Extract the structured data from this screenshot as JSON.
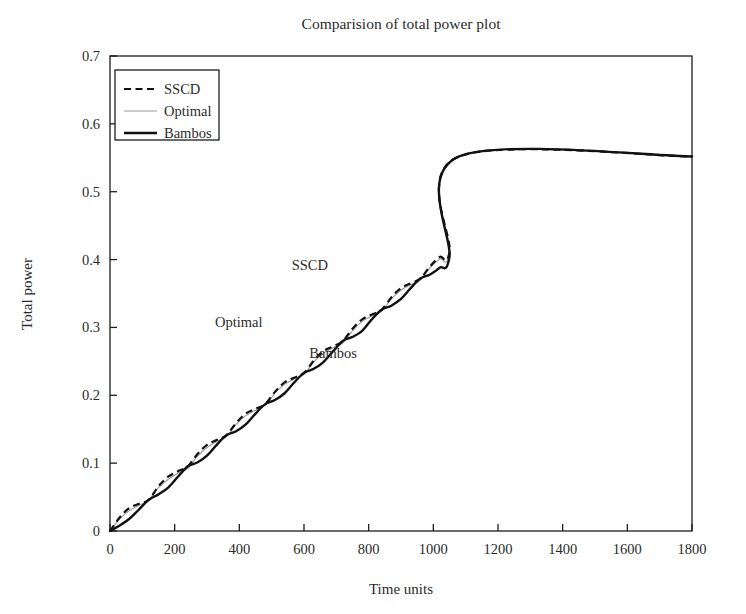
{
  "chart_data": {
    "type": "line",
    "title": "Comparision of total power plot",
    "xlabel": "Time units",
    "ylabel": "Total power",
    "xlim": [
      0,
      1800
    ],
    "ylim": [
      0,
      0.7
    ],
    "grid": false,
    "xticks": [
      "0",
      "200",
      "400",
      "600",
      "800",
      "1000",
      "1200",
      "1400",
      "1600",
      "1800"
    ],
    "xtick_values": [
      0,
      200,
      400,
      600,
      800,
      1000,
      1200,
      1400,
      1600,
      1800
    ],
    "yticks": [
      "0",
      "0.1",
      "0.2",
      "0.3",
      "0.4",
      "0.5",
      "0.6",
      "0.7"
    ],
    "ytick_values": [
      0,
      0.1,
      0.2,
      0.3,
      0.4,
      0.5,
      0.6,
      0.7
    ],
    "legend_position": "upper-left",
    "legend": [
      {
        "label": "SSCD",
        "style": "dashed",
        "color": "#111111",
        "width": 2.2
      },
      {
        "label": "Optimal",
        "style": "solid",
        "color": "#9a9a9a",
        "width": 1.1
      },
      {
        "label": "Bambos",
        "style": "solid",
        "color": "#111111",
        "width": 2.4
      }
    ],
    "annotations": [
      {
        "text": "SSCD",
        "x": 618,
        "y": 0.385
      },
      {
        "text": "Optimal",
        "x": 398,
        "y": 0.3
      },
      {
        "text": "Bambos",
        "x": 690,
        "y": 0.255
      }
    ],
    "plateau_value": 0.552,
    "plateau_start_time": 1080,
    "step_times": [
      30,
      120,
      210,
      300,
      390,
      480,
      570,
      660,
      750,
      840,
      930,
      1020,
      1080
    ],
    "series": [
      {
        "name": "SSCD",
        "x": [
          0,
          30,
          60,
          90,
          120,
          150,
          180,
          210,
          240,
          270,
          300,
          330,
          360,
          390,
          420,
          450,
          480,
          510,
          540,
          570,
          600,
          630,
          660,
          690,
          720,
          750,
          780,
          810,
          840,
          870,
          900,
          930,
          960,
          990,
          1020,
          1050,
          1080,
          1800
        ],
        "y": [
          0.0,
          0.02,
          0.034,
          0.04,
          0.046,
          0.066,
          0.08,
          0.088,
          0.095,
          0.113,
          0.127,
          0.134,
          0.141,
          0.159,
          0.173,
          0.18,
          0.187,
          0.205,
          0.219,
          0.226,
          0.233,
          0.251,
          0.265,
          0.272,
          0.28,
          0.298,
          0.312,
          0.319,
          0.326,
          0.344,
          0.358,
          0.365,
          0.372,
          0.39,
          0.404,
          0.411,
          0.552,
          0.552
        ]
      },
      {
        "name": "Optimal",
        "x": [
          0,
          30,
          60,
          90,
          120,
          150,
          180,
          210,
          240,
          270,
          300,
          330,
          360,
          390,
          420,
          450,
          480,
          510,
          540,
          570,
          600,
          630,
          660,
          690,
          720,
          750,
          780,
          810,
          840,
          870,
          900,
          930,
          960,
          990,
          1020,
          1050,
          1080,
          1800
        ],
        "y": [
          0.0,
          0.018,
          0.03,
          0.038,
          0.046,
          0.064,
          0.076,
          0.085,
          0.092,
          0.11,
          0.123,
          0.132,
          0.139,
          0.157,
          0.17,
          0.178,
          0.185,
          0.203,
          0.216,
          0.224,
          0.231,
          0.249,
          0.262,
          0.27,
          0.277,
          0.295,
          0.309,
          0.317,
          0.324,
          0.342,
          0.355,
          0.363,
          0.37,
          0.388,
          0.401,
          0.409,
          0.552,
          0.552
        ]
      },
      {
        "name": "Bambos",
        "x": [
          0,
          30,
          60,
          90,
          120,
          150,
          180,
          210,
          240,
          270,
          300,
          330,
          360,
          390,
          420,
          450,
          480,
          510,
          540,
          570,
          600,
          630,
          660,
          690,
          720,
          750,
          780,
          810,
          840,
          870,
          900,
          930,
          960,
          990,
          1020,
          1050,
          1080,
          1800
        ],
        "y": [
          0.0,
          0.008,
          0.018,
          0.032,
          0.046,
          0.054,
          0.064,
          0.08,
          0.095,
          0.101,
          0.111,
          0.127,
          0.141,
          0.147,
          0.157,
          0.173,
          0.187,
          0.193,
          0.203,
          0.219,
          0.233,
          0.239,
          0.249,
          0.265,
          0.28,
          0.286,
          0.295,
          0.312,
          0.326,
          0.332,
          0.342,
          0.358,
          0.372,
          0.378,
          0.388,
          0.404,
          0.552,
          0.552
        ]
      }
    ]
  }
}
